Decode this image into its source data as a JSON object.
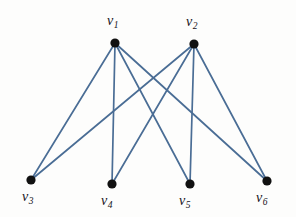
{
  "figure": {
    "type": "graph-diagram",
    "title": "",
    "background_color": "#fdfdfc",
    "edge_color": "#4a6d95",
    "vertex_color": "#111111",
    "label_color": "#15131a",
    "width": 296,
    "height": 217
  },
  "graph": {
    "kind": "complete-bipartite",
    "notation": "K(2,4)",
    "vertex_count": 6,
    "edge_count": 8,
    "vertices": [
      {
        "id": "v1",
        "label": "v",
        "subscript": "1",
        "x": 115,
        "y": 43,
        "r": 4.6,
        "label_x": 107,
        "label_y": 14
      },
      {
        "id": "v2",
        "label": "v",
        "subscript": "2",
        "x": 194,
        "y": 44,
        "r": 4.6,
        "label_x": 186,
        "label_y": 15
      },
      {
        "id": "v3",
        "label": "v",
        "subscript": "3",
        "x": 31,
        "y": 180,
        "r": 4.6,
        "label_x": 22,
        "label_y": 190
      },
      {
        "id": "v4",
        "label": "v",
        "subscript": "4",
        "x": 112,
        "y": 184,
        "r": 4.6,
        "label_x": 101,
        "label_y": 194
      },
      {
        "id": "v5",
        "label": "v",
        "subscript": "5",
        "x": 190,
        "y": 184,
        "r": 4.6,
        "label_x": 179,
        "label_y": 194
      },
      {
        "id": "v6",
        "label": "v",
        "subscript": "6",
        "x": 267,
        "y": 181,
        "r": 4.6,
        "label_x": 256,
        "label_y": 191
      }
    ],
    "edges": [
      {
        "from": "v1",
        "to": "v3",
        "x1": 115,
        "y1": 43,
        "x2": 31,
        "y2": 180
      },
      {
        "from": "v1",
        "to": "v4",
        "x1": 115,
        "y1": 43,
        "x2": 112,
        "y2": 184
      },
      {
        "from": "v1",
        "to": "v5",
        "x1": 115,
        "y1": 43,
        "x2": 190,
        "y2": 184
      },
      {
        "from": "v1",
        "to": "v6",
        "x1": 115,
        "y1": 43,
        "x2": 267,
        "y2": 181
      },
      {
        "from": "v2",
        "to": "v3",
        "x1": 194,
        "y1": 44,
        "x2": 31,
        "y2": 180
      },
      {
        "from": "v2",
        "to": "v4",
        "x1": 194,
        "y1": 44,
        "x2": 112,
        "y2": 184
      },
      {
        "from": "v2",
        "to": "v5",
        "x1": 194,
        "y1": 44,
        "x2": 190,
        "y2": 184
      },
      {
        "from": "v2",
        "to": "v6",
        "x1": 194,
        "y1": 44,
        "x2": 267,
        "y2": 181
      }
    ]
  }
}
